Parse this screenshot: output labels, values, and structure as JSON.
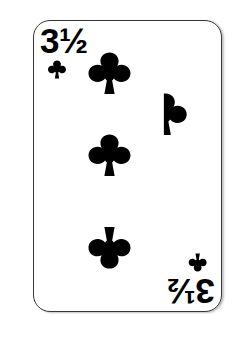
{
  "scene": {
    "subject": "playing-card",
    "background_color": "#ffffff",
    "description": "A novelty playing card showing the rank three and a half of clubs"
  },
  "card": {
    "suit": "clubs",
    "suit_symbol": "♣",
    "suit_color": "#000000",
    "rank_label": "3½",
    "rank_whole": "3",
    "rank_fraction": "½",
    "rank_numeric": 3.5,
    "face_color": "#ffffff",
    "border_color": "#35373a",
    "corner_radius_px": 17,
    "width_px": 189,
    "height_px": 292
  },
  "indices": [
    {
      "position": "top-left",
      "rank": "3½",
      "suit_symbol": "♣",
      "orientation": "upright"
    },
    {
      "position": "bottom-right",
      "rank": "3½",
      "suit_symbol": "♣",
      "orientation": "rotated-180"
    }
  ],
  "pips": {
    "total_count": "3½",
    "full_count": 3,
    "half_count": 1,
    "items": [
      {
        "id": "pip-1",
        "shape": "club",
        "fraction": "full",
        "orientation": "upright"
      },
      {
        "id": "pip-2",
        "shape": "club",
        "fraction": "full",
        "orientation": "upright"
      },
      {
        "id": "pip-3",
        "shape": "club",
        "fraction": "full",
        "orientation": "inverted"
      },
      {
        "id": "pip-half",
        "shape": "club",
        "fraction": "half",
        "orientation": "upright-right-half"
      }
    ]
  }
}
